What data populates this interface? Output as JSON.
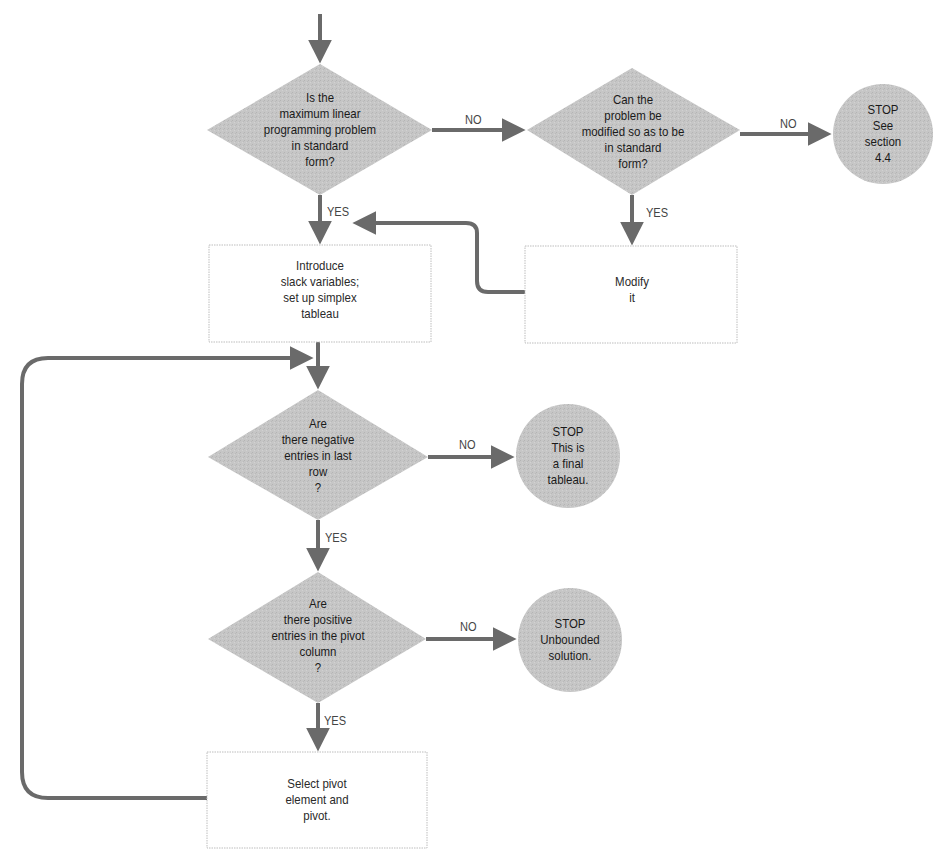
{
  "colors": {
    "shape_fill": "#c4c4c4",
    "arrow": "#6a6a6a",
    "box_border": "#bdbdbd",
    "text": "#1a1a1a"
  },
  "nodes": {
    "decision_standard_form": {
      "shape": "diamond",
      "lines": [
        "Is the",
        "maximum linear",
        "programming problem",
        "in standard",
        "form?"
      ]
    },
    "decision_can_modify": {
      "shape": "diamond",
      "lines": [
        "Can the",
        "problem be",
        "modified so as to be",
        "in standard",
        "form?"
      ]
    },
    "stop_see_section": {
      "shape": "circle",
      "lines": [
        "STOP",
        "See",
        "section",
        "4.4"
      ]
    },
    "process_introduce_slack": {
      "shape": "rectangle",
      "lines": [
        "Introduce",
        "slack variables;",
        "set up simplex",
        "tableau"
      ]
    },
    "process_modify": {
      "shape": "rectangle",
      "lines": [
        "Modify",
        "it"
      ]
    },
    "decision_negative_entries": {
      "shape": "diamond",
      "lines": [
        "Are",
        "there negative",
        "entries in last",
        "row",
        "?"
      ]
    },
    "stop_final_tableau": {
      "shape": "circle",
      "lines": [
        "STOP",
        "This is",
        "a final",
        "tableau."
      ]
    },
    "decision_positive_entries": {
      "shape": "diamond",
      "lines": [
        "Are",
        "there positive",
        "entries in the pivot",
        "column",
        "?"
      ]
    },
    "stop_unbounded": {
      "shape": "circle",
      "lines": [
        "STOP",
        "Unbounded",
        "solution."
      ]
    },
    "process_select_pivot": {
      "shape": "rectangle",
      "lines": [
        "Select pivot",
        "element and",
        "pivot."
      ]
    }
  },
  "edges": [
    {
      "from": "start",
      "to": "decision_standard_form",
      "label": ""
    },
    {
      "from": "decision_standard_form",
      "to": "decision_can_modify",
      "label": "NO"
    },
    {
      "from": "decision_can_modify",
      "to": "stop_see_section",
      "label": "NO"
    },
    {
      "from": "decision_standard_form",
      "to": "process_introduce_slack",
      "label": "YES"
    },
    {
      "from": "decision_can_modify",
      "to": "process_modify",
      "label": "YES"
    },
    {
      "from": "process_modify",
      "to": "process_introduce_slack",
      "label": ""
    },
    {
      "from": "process_introduce_slack",
      "to": "decision_negative_entries",
      "label": ""
    },
    {
      "from": "decision_negative_entries",
      "to": "stop_final_tableau",
      "label": "NO"
    },
    {
      "from": "decision_negative_entries",
      "to": "decision_positive_entries",
      "label": "YES"
    },
    {
      "from": "decision_positive_entries",
      "to": "stop_unbounded",
      "label": "NO"
    },
    {
      "from": "decision_positive_entries",
      "to": "process_select_pivot",
      "label": "YES"
    },
    {
      "from": "process_select_pivot",
      "to": "decision_negative_entries",
      "label": ""
    }
  ],
  "labels": {
    "no_1": "NO",
    "no_2": "NO",
    "yes_1": "YES",
    "yes_2": "YES",
    "no_3": "NO",
    "yes_3": "YES",
    "no_4": "NO",
    "yes_4": "YES"
  }
}
